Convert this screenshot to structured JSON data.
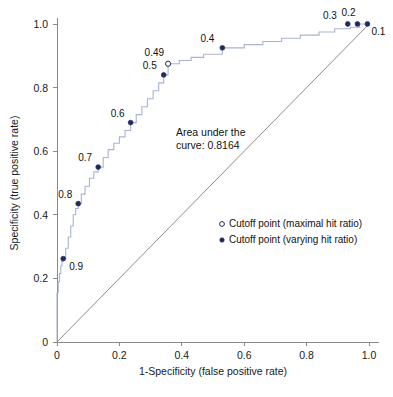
{
  "chart_data": {
    "type": "line",
    "title": "",
    "xlabel": "1-Specificity (false positive rate)",
    "ylabel": "Specificity (true positive rate)",
    "xlim": [
      0,
      1
    ],
    "ylim": [
      0,
      1
    ],
    "grid": false,
    "xticks": [
      "0",
      "0.2",
      "0.4",
      "0.6",
      "0.8",
      "1.0"
    ],
    "xtick_values": [
      0,
      0.2,
      0.4,
      0.6,
      0.8,
      1.0
    ],
    "yticks": [
      "0",
      "0.2",
      "0.4",
      "0.6",
      "0.8",
      "1.0"
    ],
    "ytick_values": [
      0,
      0.2,
      0.4,
      0.6,
      0.8,
      1.0
    ],
    "annotation": "Area under the\ncurve: 0.8164",
    "annotation_line1": "Area under the",
    "annotation_line2": "curve: 0.8164",
    "auc": 0.8164,
    "reference_line": {
      "name": "chance diagonal",
      "from": [
        0,
        0
      ],
      "to": [
        1,
        1
      ]
    },
    "series": [
      {
        "name": "ROC curve",
        "style": "step",
        "color": "#a9b4d0",
        "x": [
          0,
          0,
          0.004,
          0.004,
          0.008,
          0.008,
          0.012,
          0.012,
          0.016,
          0.016,
          0.02,
          0.02,
          0.028,
          0.028,
          0.036,
          0.036,
          0.044,
          0.044,
          0.052,
          0.052,
          0.06,
          0.06,
          0.068,
          0.068,
          0.078,
          0.078,
          0.09,
          0.09,
          0.104,
          0.104,
          0.118,
          0.118,
          0.132,
          0.132,
          0.148,
          0.148,
          0.164,
          0.164,
          0.182,
          0.182,
          0.2,
          0.2,
          0.218,
          0.218,
          0.236,
          0.236,
          0.254,
          0.254,
          0.272,
          0.272,
          0.29,
          0.29,
          0.308,
          0.308,
          0.326,
          0.326,
          0.342,
          0.342,
          0.356,
          0.356,
          0.392,
          0.392,
          0.43,
          0.43,
          0.47,
          0.47,
          0.53,
          0.53,
          0.6,
          0.6,
          0.66,
          0.66,
          0.72,
          0.72,
          0.78,
          0.78,
          0.84,
          0.84,
          0.89,
          0.89,
          0.94,
          0.94,
          0.97,
          0.97,
          1.0
        ],
        "y": [
          0,
          0.155,
          0.155,
          0.19,
          0.19,
          0.215,
          0.215,
          0.24,
          0.24,
          0.255,
          0.255,
          0.262,
          0.262,
          0.295,
          0.295,
          0.33,
          0.33,
          0.365,
          0.365,
          0.4,
          0.4,
          0.42,
          0.42,
          0.435,
          0.435,
          0.465,
          0.465,
          0.49,
          0.49,
          0.515,
          0.515,
          0.535,
          0.535,
          0.55,
          0.55,
          0.58,
          0.58,
          0.605,
          0.605,
          0.625,
          0.625,
          0.645,
          0.645,
          0.665,
          0.665,
          0.69,
          0.69,
          0.715,
          0.715,
          0.74,
          0.74,
          0.765,
          0.765,
          0.79,
          0.79,
          0.815,
          0.815,
          0.84,
          0.84,
          0.875,
          0.875,
          0.885,
          0.885,
          0.895,
          0.895,
          0.905,
          0.905,
          0.925,
          0.925,
          0.935,
          0.935,
          0.945,
          0.945,
          0.955,
          0.955,
          0.965,
          0.965,
          0.975,
          0.975,
          0.985,
          0.985,
          0.99,
          0.99,
          1.0,
          1.0
        ]
      }
    ],
    "cutoff_points": [
      {
        "label": "0.9",
        "x": 0.02,
        "y": 0.262,
        "marker": "filled",
        "label_dx": 6,
        "label_dy": 11
      },
      {
        "label": "0.8",
        "x": 0.068,
        "y": 0.435,
        "marker": "filled",
        "label_dx": -6,
        "label_dy": -6
      },
      {
        "label": "0.7",
        "x": 0.132,
        "y": 0.55,
        "marker": "filled",
        "label_dx": -6,
        "label_dy": -6
      },
      {
        "label": "0.6",
        "x": 0.236,
        "y": 0.69,
        "marker": "filled",
        "label_dx": -6,
        "label_dy": -6
      },
      {
        "label": "0.5",
        "x": 0.342,
        "y": 0.84,
        "marker": "filled",
        "label_dx": -7,
        "label_dy": -6
      },
      {
        "label": "0.49",
        "x": 0.356,
        "y": 0.875,
        "marker": "open",
        "label_dx": -4,
        "label_dy": -8
      },
      {
        "label": "0.4",
        "x": 0.53,
        "y": 0.925,
        "marker": "filled",
        "label_dx": -8,
        "label_dy": -6
      },
      {
        "label": "0.3",
        "x": 0.932,
        "y": 1.0,
        "marker": "filled",
        "label_dx": -11,
        "label_dy": -5
      },
      {
        "label": "0.2",
        "x": 0.963,
        "y": 1.0,
        "marker": "filled",
        "label_dx": -2,
        "label_dy": -8
      },
      {
        "label": "0.1",
        "x": 0.995,
        "y": 1.0,
        "marker": "filled",
        "label_dx": 4,
        "label_dy": 11
      }
    ],
    "legend": {
      "position": "center-right",
      "entries": [
        {
          "marker": "open",
          "label": "Cutoff point (maximal hit ratio)"
        },
        {
          "marker": "filled",
          "label": "Cutoff point (varying hit ratio)"
        }
      ]
    }
  },
  "colors": {
    "curve": "#a9b4d0",
    "point": "#1f2a5e",
    "axis": "#8a8a8a",
    "diagonal": "#6e6e6e",
    "background": "#ffffff"
  }
}
